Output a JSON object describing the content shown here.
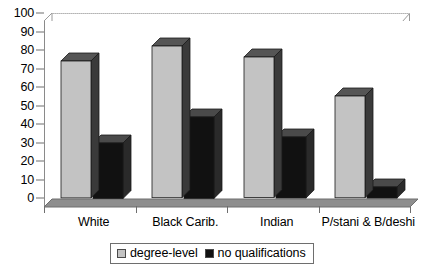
{
  "chart_data": {
    "type": "bar",
    "title": "",
    "subtitle": "",
    "xlabel": "",
    "ylabel": "",
    "categories": [
      "White",
      "Black Carib.",
      "Indian",
      "P/stani & B/deshi"
    ],
    "series": [
      {
        "name": "degree-level",
        "color": "#c3c3c3",
        "values": [
          74,
          82,
          76,
          55
        ]
      },
      {
        "name": "no qualifications",
        "color": "#111111",
        "values": [
          30,
          44,
          33,
          6
        ]
      }
    ],
    "ylim": [
      0,
      100
    ],
    "ytick_step": 10,
    "yticks": [
      "100",
      "90",
      "80",
      "70",
      "60",
      "50",
      "40",
      "30",
      "20",
      "10",
      "0"
    ],
    "grid": true,
    "grid_axis": "y",
    "legend_position": "bottom",
    "style": "3d-column",
    "legend": [
      {
        "label": "degree-level",
        "swatch": "#c3c3c3"
      },
      {
        "label": "no qualifications",
        "swatch": "#111111"
      }
    ]
  },
  "colors": {
    "bar_light_front": "#c3c3c3",
    "bar_light_top": "#555555",
    "bar_light_side": "#3a3a3a",
    "bar_dark_front": "#111111",
    "bar_dark_top": "#4a4a4a",
    "bar_dark_side": "#2a2a2a",
    "plot_background": "#ffffff",
    "floor": "#8e8e8e",
    "gridline": "#b4b4b4",
    "axis": "#6e6e6e"
  }
}
